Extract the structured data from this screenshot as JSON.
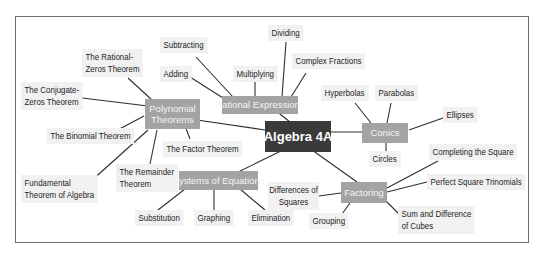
{
  "diagram": {
    "type": "mind-map",
    "center": {
      "label": "Algebra 4A",
      "color": "#3a3a3a"
    },
    "hub_color": "#a3a3a3",
    "leaf_color": "#f1f1f1",
    "hubs": [
      {
        "id": "polynomial",
        "label_line1": "Polynomial",
        "label_line2": "Theorems",
        "children": [
          {
            "line1": "The Rational-",
            "line2": "Zeros Theorem"
          },
          {
            "line1": "The Conjugate-",
            "line2": "Zeros Theorem"
          },
          {
            "line1": "The Binomial Theorem"
          },
          {
            "line1": "The Factor Theorem"
          },
          {
            "line1": "The Remainder",
            "line2": "Theorem"
          },
          {
            "line1": "Fundamental",
            "line2": "Theorem of Algebra"
          }
        ]
      },
      {
        "id": "rational",
        "label_line1": "Rational Expressions",
        "children": [
          {
            "line1": "Subtracting"
          },
          {
            "line1": "Adding"
          },
          {
            "line1": "Multiplying"
          },
          {
            "line1": "Dividing"
          },
          {
            "line1": "Complex Fractions"
          }
        ]
      },
      {
        "id": "conics",
        "label_line1": "Conics",
        "children": [
          {
            "line1": "Hyperbolas"
          },
          {
            "line1": "Parabolas"
          },
          {
            "line1": "Ellipses"
          },
          {
            "line1": "Circles"
          }
        ]
      },
      {
        "id": "systems",
        "label_line1": "Systems of Equations",
        "children": [
          {
            "line1": "Substitution"
          },
          {
            "line1": "Graphing"
          },
          {
            "line1": "Elimination"
          }
        ]
      },
      {
        "id": "factoring",
        "label_line1": "Factoring",
        "children": [
          {
            "line1": "Differences of",
            "line2": "Squares"
          },
          {
            "line1": "Grouping"
          },
          {
            "line1": "Completing the Square"
          },
          {
            "line1": "Perfect Square Trinomials"
          },
          {
            "line1": "Sum and Difference",
            "line2": "of Cubes"
          }
        ]
      }
    ]
  }
}
